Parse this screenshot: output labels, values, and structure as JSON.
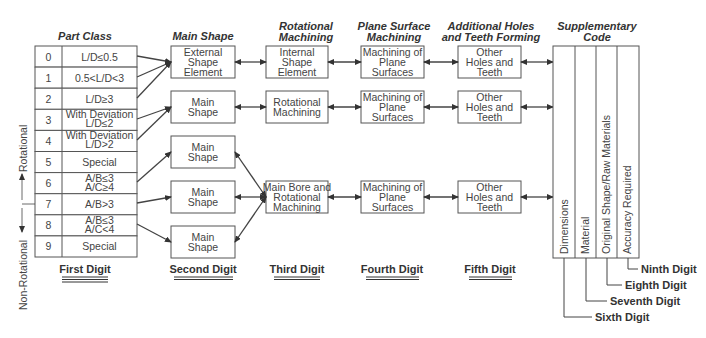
{
  "headers": {
    "part_class": "Part Class",
    "main_shape": "Main Shape",
    "rotational_1": "Rotational",
    "rotational_2": "Machining",
    "plane_1": "Plane Surface",
    "plane_2": "Machining",
    "additional_1": "Additional Holes",
    "additional_2": "and Teeth Forming",
    "supp_1": "Supplementary",
    "supp_2": "Code"
  },
  "part_class_rows": [
    {
      "num": "0",
      "l1": "L/D≤0.5",
      "l2": ""
    },
    {
      "num": "1",
      "l1": "0.5<L/D<3",
      "l2": ""
    },
    {
      "num": "2",
      "l1": "L/D≥3",
      "l2": ""
    },
    {
      "num": "3",
      "l1": "With Deviation",
      "l2": "L/D≤2"
    },
    {
      "num": "4",
      "l1": "With Deviation",
      "l2": "L/D>2"
    },
    {
      "num": "5",
      "l1": "Special",
      "l2": ""
    },
    {
      "num": "6",
      "l1": "A/B≤3",
      "l2": "A/C≥4"
    },
    {
      "num": "7",
      "l1": "A/B>3",
      "l2": ""
    },
    {
      "num": "8",
      "l1": "A/B≤3",
      "l2": "A/C<4"
    },
    {
      "num": "9",
      "l1": "Special",
      "l2": ""
    }
  ],
  "side_labels": {
    "rotational": "Rotational",
    "non_rotational": "Non-Rotational"
  },
  "main_shape_boxes": [
    {
      "l1": "External",
      "l2": "Shape",
      "l3": "Element"
    },
    {
      "l1": "Main",
      "l2": "Shape",
      "l3": ""
    },
    {
      "l1": "Main",
      "l2": "Shape",
      "l3": ""
    },
    {
      "l1": "Main",
      "l2": "Shape",
      "l3": ""
    },
    {
      "l1": "Main",
      "l2": "Shape",
      "l3": ""
    }
  ],
  "third_boxes": [
    {
      "l1": "Internal",
      "l2": "Shape",
      "l3": "Element"
    },
    {
      "l1": "Rotational",
      "l2": "Machining",
      "l3": ""
    },
    {
      "l1": "Main Bore and",
      "l2": "Rotational",
      "l3": "Machining"
    }
  ],
  "fourth_boxes": [
    {
      "l1": "Machining of",
      "l2": "Plane",
      "l3": "Surfaces"
    },
    {
      "l1": "Machining of",
      "l2": "Plane",
      "l3": "Surfaces"
    },
    {
      "l1": "Machining of",
      "l2": "Plane",
      "l3": "Surfaces"
    }
  ],
  "fifth_boxes": [
    {
      "l1": "Other",
      "l2": "Holes and",
      "l3": "Teeth"
    },
    {
      "l1": "Other",
      "l2": "Holes and",
      "l3": "Teeth"
    },
    {
      "l1": "Other",
      "l2": "Holes and",
      "l3": "Teeth"
    }
  ],
  "supplementary_columns": [
    "Dimensions",
    "Material",
    "Original Shape/Raw Materials",
    "Accuracy Required"
  ],
  "digits": {
    "first": "First Digit",
    "second": "Second Digit",
    "third": "Third Digit",
    "fourth": "Fourth Digit",
    "fifth": "Fifth Digit",
    "sixth": "Sixth Digit",
    "seventh": "Seventh Digit",
    "eighth": "Eighth Digit",
    "ninth": "Ninth Digit"
  }
}
